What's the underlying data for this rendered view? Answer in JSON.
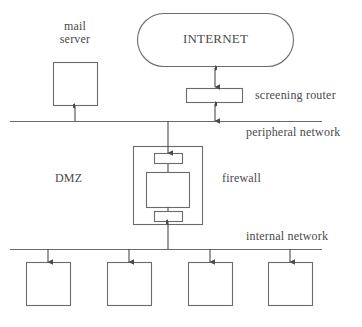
{
  "diagram": {
    "type": "network-topology",
    "colors": {
      "stroke": "#6b6b6b",
      "text": "#4a4a4a",
      "background": "#ffffff"
    },
    "labels": {
      "mail_server_line1": "mail",
      "mail_server_line2": "server",
      "internet": "INTERNET",
      "screening_router": "screening router",
      "peripheral_network": "peripheral network",
      "dmz": "DMZ",
      "firewall": "firewall",
      "internal_network": "internal network"
    },
    "nodes": [
      {
        "id": "internet",
        "label": "INTERNET",
        "shape": "stadium",
        "x": 137,
        "y": 13,
        "w": 157,
        "h": 54
      },
      {
        "id": "mail-server",
        "label": "mail server",
        "shape": "rect",
        "x": 53,
        "y": 62,
        "w": 45,
        "h": 44
      },
      {
        "id": "screening-router",
        "label": "screening router",
        "shape": "rect",
        "x": 186,
        "y": 88,
        "w": 57,
        "h": 15
      },
      {
        "id": "firewall-outer",
        "label": "firewall",
        "shape": "rect",
        "x": 133,
        "y": 146,
        "w": 70,
        "h": 79
      },
      {
        "id": "firewall-top-port",
        "label": "",
        "shape": "rect",
        "x": 154,
        "y": 153,
        "w": 29,
        "h": 11
      },
      {
        "id": "firewall-core",
        "label": "",
        "shape": "rect",
        "x": 146,
        "y": 172,
        "w": 44,
        "h": 36
      },
      {
        "id": "firewall-bottom-port",
        "label": "",
        "shape": "rect",
        "x": 154,
        "y": 211,
        "w": 29,
        "h": 11
      },
      {
        "id": "host-1",
        "label": "",
        "shape": "rect",
        "x": 26,
        "y": 262,
        "w": 45,
        "h": 44
      },
      {
        "id": "host-2",
        "label": "",
        "shape": "rect",
        "x": 107,
        "y": 262,
        "w": 45,
        "h": 44
      },
      {
        "id": "host-3",
        "label": "",
        "shape": "rect",
        "x": 188,
        "y": 262,
        "w": 45,
        "h": 44
      },
      {
        "id": "host-4",
        "label": "",
        "shape": "rect",
        "x": 268,
        "y": 262,
        "w": 45,
        "h": 44
      }
    ],
    "bus_lines": [
      {
        "id": "peripheral-network-bus",
        "label": "peripheral network",
        "x1": 10,
        "y1": 121,
        "x2": 322,
        "y2": 121
      },
      {
        "id": "internal-network-bus",
        "label": "internal network",
        "x1": 10,
        "y1": 249,
        "x2": 322,
        "y2": 249
      }
    ],
    "connections": [
      {
        "id": "internet-to-router",
        "from": "internet",
        "to": "screening-router",
        "arrows": "both"
      },
      {
        "id": "router-to-peripheral",
        "from": "screening-router",
        "to": "peripheral-network-bus",
        "arrows": "both"
      },
      {
        "id": "peripheral-to-mail-server",
        "from": "peripheral-network-bus",
        "to": "mail-server",
        "arrows": "up"
      },
      {
        "id": "peripheral-to-firewall",
        "from": "peripheral-network-bus",
        "to": "firewall-top-port",
        "arrows": "down"
      },
      {
        "id": "firewall-to-internal",
        "from": "firewall-bottom-port",
        "to": "internal-network-bus",
        "arrows": "up"
      },
      {
        "id": "internal-to-host-1",
        "from": "internal-network-bus",
        "to": "host-1",
        "arrows": "down"
      },
      {
        "id": "internal-to-host-2",
        "from": "internal-network-bus",
        "to": "host-2",
        "arrows": "down"
      },
      {
        "id": "internal-to-host-3",
        "from": "internal-network-bus",
        "to": "host-3",
        "arrows": "down"
      },
      {
        "id": "internal-to-host-4",
        "from": "internal-network-bus",
        "to": "host-4",
        "arrows": "down"
      }
    ]
  }
}
